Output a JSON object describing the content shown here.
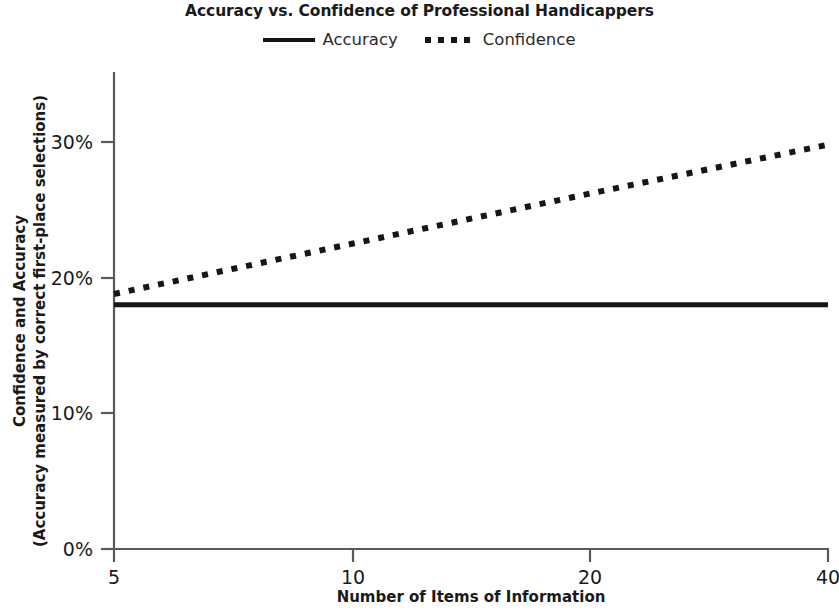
{
  "chart_data": {
    "type": "line",
    "title": "Accuracy vs. Confidence of Professional Handicappers",
    "xlabel": "Number of Items of Information",
    "ylabel_line1": "Confidence and Accuracy",
    "ylabel_line2": "(Accuracy measured by correct first-place selections)",
    "x_scale": "log",
    "x": [
      5,
      10,
      20,
      40
    ],
    "xticklabels": [
      "5",
      "10",
      "20",
      "40"
    ],
    "xlim": [
      5,
      40
    ],
    "yticks": [
      0,
      10,
      20,
      30
    ],
    "yticklabels": [
      "0%",
      "10%",
      "20%",
      "30%"
    ],
    "ylim": [
      0,
      35
    ],
    "grid": false,
    "legend_position": "top-center",
    "series": [
      {
        "name": "Accuracy",
        "style": "solid",
        "color": "#161616",
        "values": [
          18,
          18,
          18,
          18
        ]
      },
      {
        "name": "Confidence",
        "style": "dotted",
        "color": "#161616",
        "values": [
          18.8,
          22.5,
          26.2,
          29.8
        ]
      }
    ],
    "annotations": []
  },
  "legend": {
    "entries": [
      {
        "label": "Accuracy",
        "marker": "solid-line-swatch"
      },
      {
        "label": "Confidence",
        "marker": "dotted-line-swatch"
      }
    ]
  },
  "axes": {
    "y_ticks": [
      {
        "label": "30%"
      },
      {
        "label": "20%"
      },
      {
        "label": "10%"
      },
      {
        "label": "0%"
      }
    ],
    "x_ticks": [
      {
        "label": "5"
      },
      {
        "label": "10"
      },
      {
        "label": "20"
      },
      {
        "label": "40"
      }
    ]
  }
}
